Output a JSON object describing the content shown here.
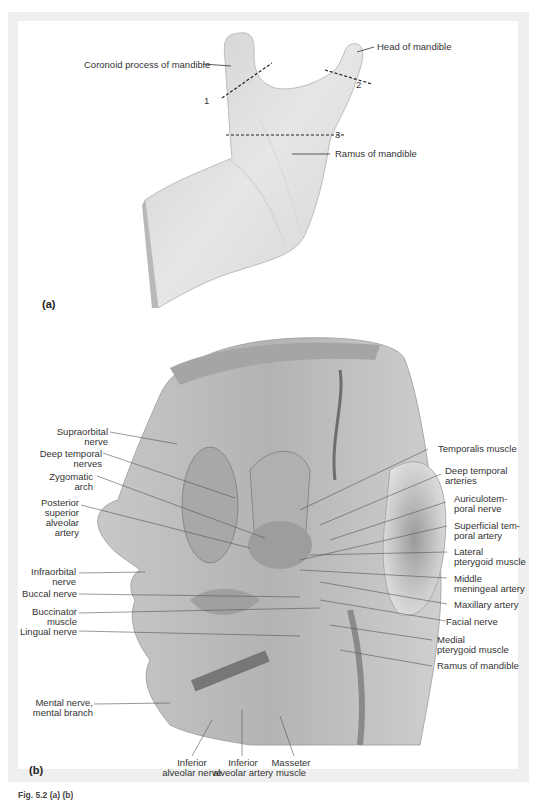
{
  "figure": {
    "panel_a": {
      "label": "(a)",
      "labels": {
        "coronoid": "Coronoid process of mandible",
        "head": "Head of mandible",
        "ramus": "Ramus of mandible",
        "cut1": "1",
        "cut2": "2",
        "cut3": "3"
      }
    },
    "panel_b": {
      "label": "(b)",
      "left_labels": [
        {
          "l1": "Supraorbital",
          "l2": "nerve"
        },
        {
          "l1": "Deep temporal",
          "l2": "nerves"
        },
        {
          "l1": "Zygomatic",
          "l2": "arch"
        },
        {
          "l1": "Posterior",
          "l2": "superior",
          "l3": "alveolar",
          "l4": "artery"
        },
        {
          "l1": "Infraorbital",
          "l2": "nerve"
        },
        {
          "l1": "Buccal nerve"
        },
        {
          "l1": "Buccinator",
          "l2": "muscle"
        },
        {
          "l1": "Lingual nerve"
        },
        {
          "l1": "Mental nerve,",
          "l2": "mental branch"
        }
      ],
      "right_labels": [
        {
          "l1": "Temporalis muscle"
        },
        {
          "l1": "Deep temporal",
          "l2": "arteries"
        },
        {
          "l1": "Auriculotem-",
          "l2": "poral nerve"
        },
        {
          "l1": "Superficial tem-",
          "l2": "poral artery"
        },
        {
          "l1": "Lateral",
          "l2": "pterygoid muscle"
        },
        {
          "l1": "Middle",
          "l2": "meningeal artery"
        },
        {
          "l1": "Maxillary artery"
        },
        {
          "l1": "Facial nerve"
        },
        {
          "l1": "Medial",
          "l2": "pterygoid muscle"
        },
        {
          "l1": "Ramus of mandible"
        }
      ],
      "bottom_labels": [
        {
          "l1": "Inferior",
          "l2": "alveolar nerve"
        },
        {
          "l1": "Inferior",
          "l2": "alveolar artery"
        },
        {
          "l1": "Masseter",
          "l2": "muscle"
        }
      ]
    },
    "caption": "Fig. 5.2 (a) (b)"
  }
}
